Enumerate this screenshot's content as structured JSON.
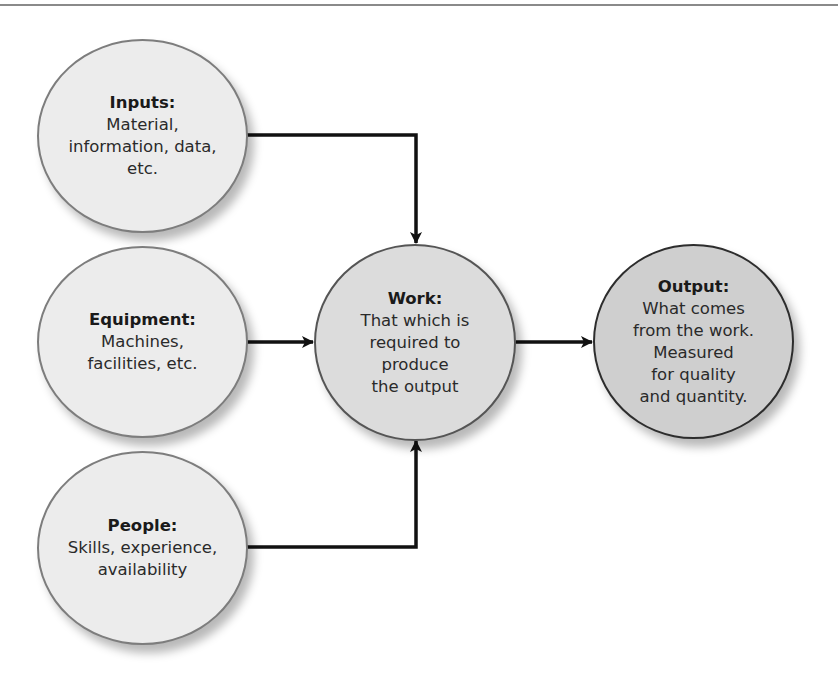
{
  "diagram": {
    "nodes": {
      "inputs": {
        "title": "Inputs:",
        "body": "Material,\ninformation, data,\netc."
      },
      "equipment": {
        "title": "Equipment:",
        "body": "Machines,\nfacilities, etc."
      },
      "people": {
        "title": "People:",
        "body": "Skills, experience,\navailability"
      },
      "work": {
        "title": "Work:",
        "body": "That which is\nrequired to\nproduce\nthe output"
      },
      "output": {
        "title": "Output:",
        "body": "What comes\nfrom the work.\nMeasured\nfor quality\nand quantity."
      }
    },
    "edges": [
      {
        "from": "inputs",
        "to": "work"
      },
      {
        "from": "equipment",
        "to": "work"
      },
      {
        "from": "people",
        "to": "work"
      },
      {
        "from": "work",
        "to": "output"
      }
    ],
    "colors": {
      "light_fill": "#ececec",
      "work_fill": "#dcdcdc",
      "output_fill": "#cfcfcf",
      "line": "#111111",
      "rule": "#8a8a8a"
    }
  }
}
